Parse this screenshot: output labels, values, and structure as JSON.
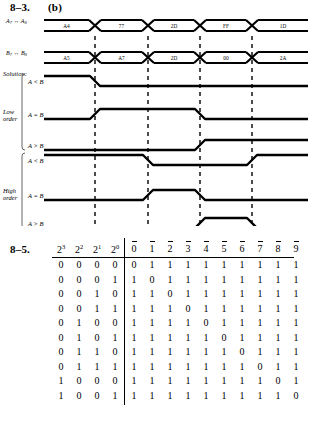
{
  "problem_83": {
    "number": "8–3.",
    "part": "(b)",
    "solution_label": "Solution:",
    "bus_rows": [
      {
        "label_main": "A",
        "label_sub_hi": "7",
        "label_arrow": "↔",
        "label_sub_lo": "0",
        "values": [
          "A4",
          "77",
          "2D",
          "FF",
          "1D"
        ]
      },
      {
        "label_main": "B",
        "label_sub_hi": "7",
        "label_arrow": "↔",
        "label_sub_lo": "0",
        "values": [
          "A5",
          "A7",
          "2D",
          "00",
          "2A"
        ]
      }
    ],
    "groups": [
      {
        "name": "low-order",
        "label_line1": "Low",
        "label_line2": "order",
        "signals": [
          {
            "label": "A < B",
            "levels": [
              1,
              0,
              0,
              0,
              0
            ]
          },
          {
            "label": "A = B",
            "levels": [
              0,
              1,
              1,
              0,
              0
            ]
          },
          {
            "label": "A > B",
            "levels": [
              0,
              0,
              0,
              1,
              1
            ]
          }
        ]
      },
      {
        "name": "high-order",
        "label_line1": "High",
        "label_line2": "order",
        "signals": [
          {
            "label": "A < B",
            "levels": [
              1,
              1,
              0,
              0,
              1
            ]
          },
          {
            "label": "A = B",
            "levels": [
              0,
              0,
              1,
              0,
              0
            ]
          },
          {
            "label": "A > B",
            "levels": [
              0,
              0,
              0,
              1,
              0
            ]
          }
        ]
      }
    ]
  },
  "problem_85": {
    "number": "8–5.",
    "input_headers": [
      {
        "base": "2",
        "exp": "3"
      },
      {
        "base": "2",
        "exp": "2"
      },
      {
        "base": "2",
        "exp": "1"
      },
      {
        "base": "2",
        "exp": "0"
      }
    ],
    "output_headers": [
      "0",
      "1",
      "2",
      "3",
      "4",
      "5",
      "6",
      "7",
      "8",
      "9"
    ],
    "rows": [
      {
        "inputs": [
          "0",
          "0",
          "0",
          "0"
        ],
        "outputs": [
          "0",
          "1",
          "1",
          "1",
          "1",
          "1",
          "1",
          "1",
          "1",
          "1"
        ]
      },
      {
        "inputs": [
          "0",
          "0",
          "0",
          "1"
        ],
        "outputs": [
          "1",
          "0",
          "1",
          "1",
          "1",
          "1",
          "1",
          "1",
          "1",
          "1"
        ]
      },
      {
        "inputs": [
          "0",
          "0",
          "1",
          "0"
        ],
        "outputs": [
          "1",
          "1",
          "0",
          "1",
          "1",
          "1",
          "1",
          "1",
          "1",
          "1"
        ]
      },
      {
        "inputs": [
          "0",
          "0",
          "1",
          "1"
        ],
        "outputs": [
          "1",
          "1",
          "1",
          "0",
          "1",
          "1",
          "1",
          "1",
          "1",
          "1"
        ]
      },
      {
        "inputs": [
          "0",
          "1",
          "0",
          "0"
        ],
        "outputs": [
          "1",
          "1",
          "1",
          "1",
          "0",
          "1",
          "1",
          "1",
          "1",
          "1"
        ]
      },
      {
        "inputs": [
          "0",
          "1",
          "0",
          "1"
        ],
        "outputs": [
          "1",
          "1",
          "1",
          "1",
          "1",
          "0",
          "1",
          "1",
          "1",
          "1"
        ]
      },
      {
        "inputs": [
          "0",
          "1",
          "1",
          "0"
        ],
        "outputs": [
          "1",
          "1",
          "1",
          "1",
          "1",
          "1",
          "0",
          "1",
          "1",
          "1"
        ]
      },
      {
        "inputs": [
          "0",
          "1",
          "1",
          "1"
        ],
        "outputs": [
          "1",
          "1",
          "1",
          "1",
          "1",
          "1",
          "1",
          "0",
          "1",
          "1"
        ]
      },
      {
        "inputs": [
          "1",
          "0",
          "0",
          "0"
        ],
        "outputs": [
          "1",
          "1",
          "1",
          "1",
          "1",
          "1",
          "1",
          "1",
          "0",
          "1"
        ]
      },
      {
        "inputs": [
          "1",
          "0",
          "0",
          "1"
        ],
        "outputs": [
          "1",
          "1",
          "1",
          "1",
          "1",
          "1",
          "1",
          "1",
          "1",
          "0"
        ]
      }
    ]
  },
  "colors": {
    "ink": "#000000",
    "paper": "#ffffff"
  }
}
